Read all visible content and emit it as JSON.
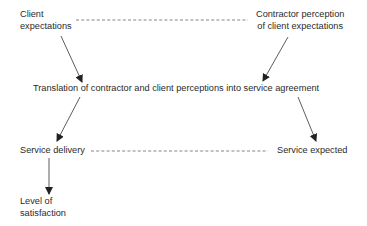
{
  "diagram": {
    "type": "flow",
    "colors": {
      "text": "#2a2a2a",
      "line": "#333333",
      "dashed": "#555555",
      "background": "#ffffff"
    },
    "nodes": {
      "client_expectations": {
        "lines": [
          "Client",
          "expectations"
        ]
      },
      "contractor_perception": {
        "lines": [
          "Contractor perception",
          "of client expectations"
        ]
      },
      "translation": {
        "label": "Translation of contractor and client perceptions into service agreement"
      },
      "service_delivery": {
        "label": "Service delivery"
      },
      "service_expected": {
        "label": "Service expected"
      },
      "level_of_satisfaction": {
        "lines": [
          "Level of",
          "satisfaction"
        ]
      }
    },
    "edges": [
      {
        "from": "client_expectations",
        "to": "translation",
        "style": "arrow"
      },
      {
        "from": "contractor_perception",
        "to": "translation",
        "style": "arrow"
      },
      {
        "from": "translation",
        "to": "service_delivery",
        "style": "arrow"
      },
      {
        "from": "translation",
        "to": "service_expected",
        "style": "arrow"
      },
      {
        "from": "service_delivery",
        "to": "level_of_satisfaction",
        "style": "arrow"
      },
      {
        "from": "client_expectations",
        "to": "contractor_perception",
        "style": "dashed"
      },
      {
        "from": "service_delivery",
        "to": "service_expected",
        "style": "dashed"
      }
    ]
  }
}
